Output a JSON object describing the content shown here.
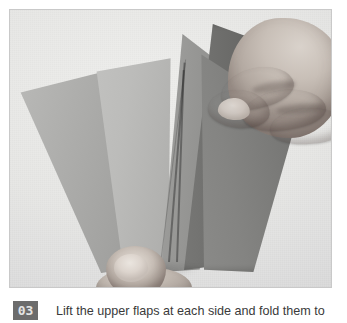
{
  "page": {
    "background_color": "#ffffff"
  },
  "photo": {
    "name": "paper-folding-step-photo",
    "alt": "A pair of hands fanning out folded paper flaps against a light gray background",
    "backdrop_color": "#e9e9e7",
    "border_color": "#c9c9c9",
    "subject": "hands-holding-fanned-paper-flaps",
    "flaps": [
      {
        "id": "flap-1",
        "tone": "#adadab",
        "position": "far-left"
      },
      {
        "id": "flap-2",
        "tone": "#bcbcba",
        "position": "left"
      },
      {
        "id": "flap-3",
        "tone": "#9b9b99",
        "position": "center"
      },
      {
        "id": "flap-4",
        "tone": "#747472",
        "position": "center-right-back"
      },
      {
        "id": "flap-5",
        "tone": "#848482",
        "position": "right"
      }
    ],
    "hands": [
      {
        "id": "hand-upper",
        "description": "right hand gripping the top edge of the upper flap"
      },
      {
        "id": "hand-lower",
        "description": "thumb pinching the base of the fan"
      }
    ]
  },
  "caption": {
    "step_number": "03",
    "badge_background": "#6c6c6c",
    "badge_text_color": "#e4e4e4",
    "text": "Lift the upper flaps at each side and fold them to",
    "text_color": "#3a3a3a"
  }
}
